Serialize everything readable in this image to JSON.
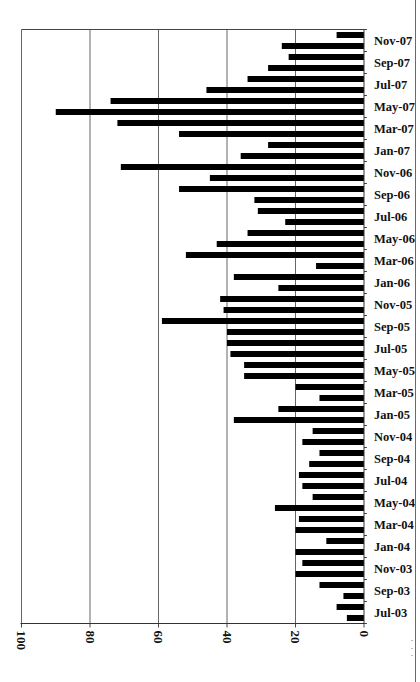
{
  "chart_data": {
    "type": "bar",
    "orientation": "horizontal-rotated",
    "title": "",
    "xlabel": "",
    "ylabel": "",
    "value_axis": {
      "min": 0,
      "max": 100,
      "ticks": [
        100,
        80,
        60,
        40,
        20,
        0
      ],
      "gridlines": true,
      "reversed": true,
      "tick_label_rotation": 90
    },
    "category_axis": {
      "position": "right",
      "label_interval": 2,
      "tick_labels": [
        "Nov-07",
        "Sep-07",
        "Jul-07",
        "May-07",
        "Mar-07",
        "Jan-07",
        "Nov-06",
        "Sep-06",
        "Jul-06",
        "May-06",
        "Mar-06",
        "Jan-06",
        "Nov-05",
        "Sep-05",
        "Jul-05",
        "May-05",
        "Mar-05",
        "Jan-05",
        "Nov-04",
        "Sep-04",
        "Jul-04",
        "May-04",
        "Mar-04",
        "Jan-04",
        "Nov-03",
        "Sep-03",
        "Jul-03"
      ]
    },
    "legend": null,
    "bar_color": "#000000",
    "categories": [
      "Dec-07",
      "Nov-07",
      "Oct-07",
      "Sep-07",
      "Aug-07",
      "Jul-07",
      "Jun-07",
      "May-07",
      "Apr-07",
      "Mar-07",
      "Feb-07",
      "Jan-07",
      "Dec-06",
      "Nov-06",
      "Oct-06",
      "Sep-06",
      "Aug-06",
      "Jul-06",
      "Jun-06",
      "May-06",
      "Apr-06",
      "Mar-06",
      "Feb-06",
      "Jan-06",
      "Dec-05",
      "Nov-05",
      "Oct-05",
      "Sep-05",
      "Aug-05",
      "Jul-05",
      "Jun-05",
      "May-05",
      "Apr-05",
      "Mar-05",
      "Feb-05",
      "Jan-05",
      "Dec-04",
      "Nov-04",
      "Oct-04",
      "Sep-04",
      "Aug-04",
      "Jul-04",
      "Jun-04",
      "May-04",
      "Apr-04",
      "Mar-04",
      "Feb-04",
      "Jan-04",
      "Dec-03",
      "Nov-03",
      "Oct-03",
      "Sep-03",
      "Aug-03",
      "Jul-03"
    ],
    "values": [
      8,
      24,
      22,
      28,
      34,
      46,
      74,
      90,
      72,
      54,
      28,
      36,
      71,
      45,
      54,
      32,
      31,
      23,
      34,
      43,
      52,
      14,
      38,
      25,
      42,
      41,
      59,
      40,
      40,
      39,
      35,
      35,
      20,
      13,
      25,
      38,
      15,
      18,
      13,
      16,
      19,
      18,
      15,
      26,
      19,
      20,
      11,
      20,
      18,
      20,
      13,
      6,
      8,
      5
    ]
  }
}
